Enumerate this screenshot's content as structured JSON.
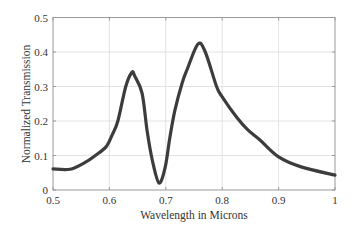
{
  "chart_data": {
    "type": "line",
    "title": "",
    "xlabel": "Wavelength in Microns",
    "ylabel": "Normalized Transmission",
    "xlim": [
      0.5,
      1.0
    ],
    "ylim": [
      0,
      0.5
    ],
    "grid": true,
    "legend": null,
    "x_ticks": [
      "0.5",
      "0.6",
      "0.7",
      "0.8",
      "0.9",
      "1"
    ],
    "y_ticks": [
      "0",
      "0.1",
      "0.2",
      "0.3",
      "0.4",
      "0.5"
    ],
    "series": [
      {
        "name": "Transmission",
        "color": "#3c3c3c",
        "x": [
          0.5,
          0.53,
          0.557,
          0.575,
          0.594,
          0.605,
          0.615,
          0.629,
          0.64,
          0.645,
          0.658,
          0.667,
          0.676,
          0.688,
          0.699,
          0.707,
          0.716,
          0.729,
          0.738,
          0.757,
          0.77,
          0.79,
          0.8,
          0.826,
          0.845,
          0.867,
          0.9,
          0.94,
          1.0
        ],
        "values": [
          0.061,
          0.06,
          0.08,
          0.1,
          0.125,
          0.16,
          0.2,
          0.3,
          0.341,
          0.33,
          0.28,
          0.17,
          0.087,
          0.02,
          0.067,
          0.15,
          0.23,
          0.31,
          0.35,
          0.423,
          0.4,
          0.3,
          0.27,
          0.21,
          0.175,
          0.145,
          0.096,
          0.067,
          0.043
        ]
      }
    ]
  },
  "colors": {
    "line": "#3c3c3c",
    "grid": "#dcdcdc",
    "axis": "#9a9a9a",
    "text": "#333333"
  }
}
